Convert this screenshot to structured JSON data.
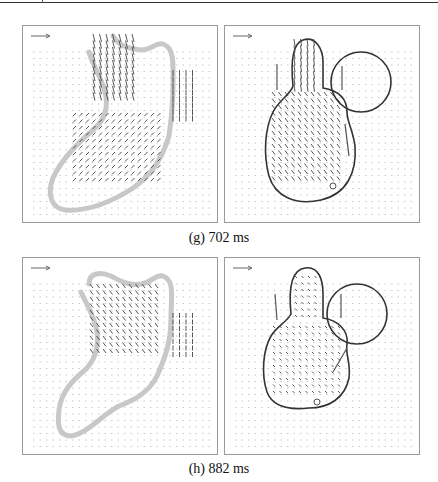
{
  "figure": {
    "rows": [
      {
        "caption": "(g) 702 ms",
        "panels": [
          {
            "id": "g-left",
            "type": "measured-velocity-field",
            "outline": "grey-ventricle-boundary"
          },
          {
            "id": "g-right",
            "type": "simulated-velocity-field",
            "outline": "ventricle-atrium-contour"
          }
        ]
      },
      {
        "caption": "(h) 882 ms",
        "panels": [
          {
            "id": "h-left",
            "type": "measured-velocity-field",
            "outline": "grey-ventricle-boundary"
          },
          {
            "id": "h-right",
            "type": "simulated-velocity-field",
            "outline": "ventricle-atrium-contour"
          }
        ]
      }
    ],
    "icons": {
      "reference_arrow": "scale-arrow-icon"
    },
    "colors": {
      "outline_grey": "#c8c8c8",
      "contour": "#333333",
      "arrow": "#555555",
      "frame": "#9a9a9a"
    }
  }
}
